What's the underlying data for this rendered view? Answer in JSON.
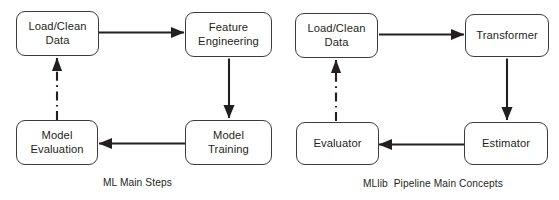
{
  "figure": {
    "background_color": "#ffffff",
    "stroke_color": "#231f20",
    "box_border_color": "#3c3c3c",
    "text_color": "#231f20"
  },
  "diagrams": [
    {
      "id": "ml-main-steps",
      "caption": "ML Main Steps",
      "nodes": [
        {
          "id": "load-clean-data",
          "label": "Load/Clean\nData",
          "line1": "Load/Clean",
          "line2": "Data"
        },
        {
          "id": "feature-engineering",
          "label": "Feature\nEngineering",
          "line1": "Feature",
          "line2": "Engineering"
        },
        {
          "id": "model-training",
          "label": "Model\nTraining",
          "line1": "Model",
          "line2": "Training"
        },
        {
          "id": "model-evaluation",
          "label": "Model\nEvaluation",
          "line1": "Model",
          "line2": "Evaluation"
        }
      ],
      "edges": [
        {
          "id": "edge-load-to-feature",
          "from": "load-clean-data",
          "to": "feature-engineering",
          "style": "solid",
          "direction": "right"
        },
        {
          "id": "edge-feature-to-training",
          "from": "feature-engineering",
          "to": "model-training",
          "style": "solid",
          "direction": "down"
        },
        {
          "id": "edge-training-to-evaluation",
          "from": "model-training",
          "to": "model-evaluation",
          "style": "solid",
          "direction": "left"
        },
        {
          "id": "edge-evaluation-to-load",
          "from": "model-evaluation",
          "to": "load-clean-data",
          "style": "dash-dot",
          "direction": "up"
        }
      ]
    },
    {
      "id": "mllib-pipeline-main-concepts",
      "caption": "MLlib  Pipeline Main Concepts",
      "nodes": [
        {
          "id": "load-clean-data-2",
          "label": "Load/Clean\nData",
          "line1": "Load/Clean",
          "line2": "Data"
        },
        {
          "id": "transformer",
          "label": "Transformer",
          "line1": "Transformer",
          "line2": ""
        },
        {
          "id": "estimator",
          "label": "Estimator",
          "line1": "Estimator",
          "line2": ""
        },
        {
          "id": "evaluator",
          "label": "Evaluator",
          "line1": "Evaluator",
          "line2": ""
        }
      ],
      "edges": [
        {
          "id": "edge-load2-to-transformer",
          "from": "load-clean-data-2",
          "to": "transformer",
          "style": "solid",
          "direction": "right"
        },
        {
          "id": "edge-transformer-to-estimator",
          "from": "transformer",
          "to": "estimator",
          "style": "solid",
          "direction": "down"
        },
        {
          "id": "edge-estimator-to-evaluator",
          "from": "estimator",
          "to": "evaluator",
          "style": "solid",
          "direction": "left"
        },
        {
          "id": "edge-evaluator-to-load2",
          "from": "evaluator",
          "to": "load-clean-data-2",
          "style": "dash-dot",
          "direction": "up"
        }
      ]
    }
  ]
}
